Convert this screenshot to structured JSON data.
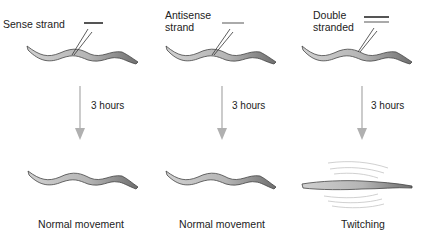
{
  "columns": [
    {
      "strand_label": "Sense strand",
      "strand_lines": [
        "#555555"
      ],
      "time_label": "3 hours",
      "outcome": "Normal movement"
    },
    {
      "strand_label_line1": "Antisense",
      "strand_label_line2": "strand",
      "strand_lines": [
        "#aaaaaa"
      ],
      "time_label": "3 hours",
      "outcome": "Normal movement"
    },
    {
      "strand_label_line1": "Double",
      "strand_label_line2": "stranded",
      "strand_lines": [
        "#555555",
        "#aaaaaa"
      ],
      "time_label": "3 hours",
      "outcome": "Twitching"
    }
  ],
  "colors": {
    "worm_light": "#c8c8c8",
    "worm_dark": "#7a7a7a",
    "arrow": "#b0b0b0",
    "needle": "#333333"
  }
}
